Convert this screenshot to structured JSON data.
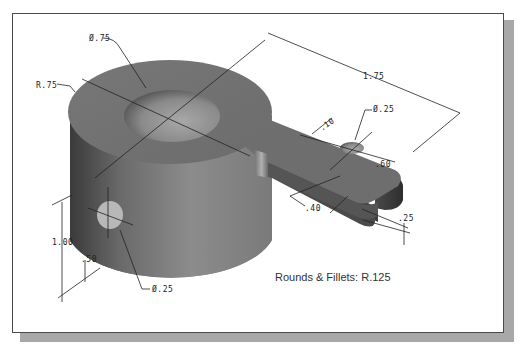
{
  "drawing": {
    "title": "Isometric part with dimensions",
    "dimensions": {
      "top_hole_diameter": "Ø.75",
      "boss_radius": "R.75",
      "overall_length": "1.75",
      "arm_hole_diameter": "Ø.25",
      "arm_hole_offset": ".10",
      "arm_width": ".60",
      "arm_slot_depth": ".40",
      "arm_thickness": ".25",
      "boss_height": "1.00",
      "side_hole_height": ".50",
      "side_hole_diameter": "Ø.25"
    },
    "note": "Rounds & Fillets: R.125"
  },
  "colors": {
    "frame_border": "#4a4a4a",
    "frame_shadow": "#a8a8a8",
    "part_top": "#7a7a7a",
    "part_side_dark": "#3e3e3e",
    "part_side_light": "#9a9a9a",
    "dimension_line": "#222222"
  }
}
